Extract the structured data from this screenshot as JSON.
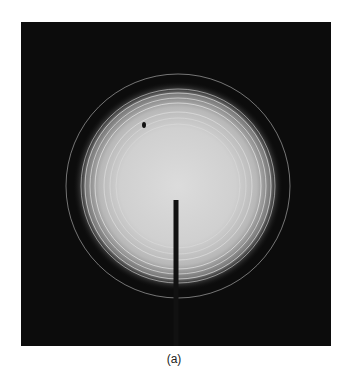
{
  "figure": {
    "type": "electron/x-ray powder diffraction pattern photograph",
    "background_color": "#0c0c0c",
    "center": [
      157,
      164
    ],
    "halo_radius": 80,
    "rings": [
      {
        "r": 62,
        "opacity": 0.25
      },
      {
        "r": 68,
        "opacity": 0.3
      },
      {
        "r": 74,
        "opacity": 0.45
      },
      {
        "r": 83,
        "opacity": 0.6
      },
      {
        "r": 88,
        "opacity": 0.55
      },
      {
        "r": 93,
        "opacity": 0.6
      },
      {
        "r": 97,
        "opacity": 0.5
      },
      {
        "r": 112,
        "opacity": 0.45
      }
    ],
    "beam_stop": {
      "x": 155,
      "y_top": 178,
      "width": 5
    },
    "caption": "(a)"
  }
}
